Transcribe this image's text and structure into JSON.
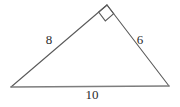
{
  "figure": {
    "kind": "geometry-diagram",
    "shape": "right-triangle",
    "background_color": "#ffffff",
    "stroke_color": "#5a5a5a",
    "base_stroke_color": "#7d7d7d",
    "label_color": "#2b2b2b",
    "width": 180,
    "height": 107
  },
  "vertices": {
    "left": {
      "x": 11,
      "y": 87
    },
    "apex": {
      "x": 107,
      "y": 5
    },
    "right": {
      "x": 169,
      "y": 86
    }
  },
  "right_angle_marker": {
    "at_vertex": "apex",
    "size": 11,
    "present": true
  },
  "sides": [
    {
      "name": "left-leg",
      "label": "8",
      "label_x": 49,
      "label_y": 41,
      "from": "left",
      "to": "apex"
    },
    {
      "name": "right-leg",
      "label": "6",
      "label_x": 140,
      "label_y": 41,
      "from": "apex",
      "to": "right"
    },
    {
      "name": "hypotenuse-base",
      "label": "10",
      "label_x": 92,
      "label_y": 96,
      "from": "left",
      "to": "right"
    }
  ]
}
